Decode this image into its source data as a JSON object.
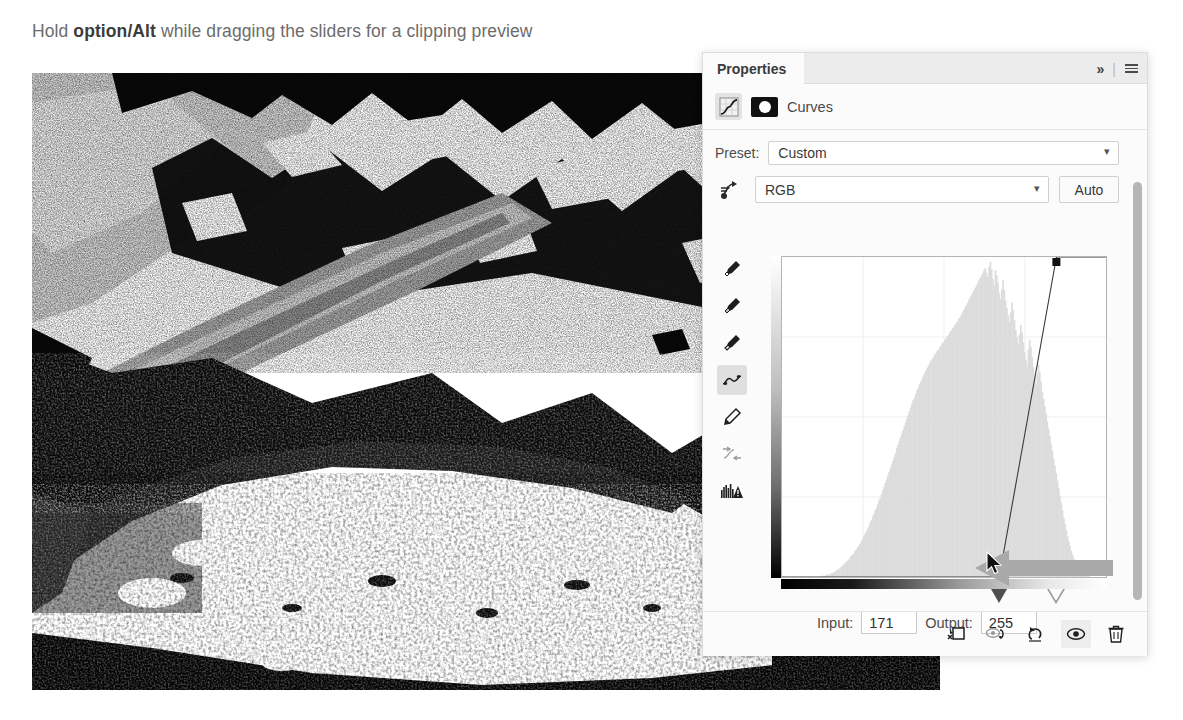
{
  "caption": {
    "prefix": "Hold ",
    "bold": "option/Alt",
    "suffix": " while dragging the sliders for a clipping preview"
  },
  "photo": {
    "alt_name": "clipped-glacier-preview",
    "description": "High-contrast black and white glacier and mountain photograph showing clipping preview"
  },
  "panel": {
    "tab_label": "Properties",
    "expand_icon": "chevron-double-right-icon",
    "menu_icon": "hamburger-menu-icon",
    "adjustment": {
      "layer_icon": "curves-adjustment-icon",
      "mask_icon": "layer-mask-icon",
      "title": "Curves"
    },
    "preset": {
      "label": "Preset:",
      "value": "Custom",
      "caret_icon": "chevron-down-icon"
    },
    "channel": {
      "target_icon": "targeted-adjustment-icon",
      "value": "RGB",
      "caret_icon": "chevron-down-icon",
      "auto_label": "Auto"
    },
    "tools": [
      {
        "name": "eyedropper-black-point",
        "icon": "eyedropper-icon",
        "active": false
      },
      {
        "name": "eyedropper-gray-point",
        "icon": "eyedropper-icon",
        "active": false
      },
      {
        "name": "eyedropper-white-point",
        "icon": "eyedropper-icon",
        "active": false
      },
      {
        "name": "curve-point-tool",
        "icon": "curve-icon",
        "active": true
      },
      {
        "name": "pencil-draw-tool",
        "icon": "pencil-icon",
        "active": false
      },
      {
        "name": "smooth-curve-tool",
        "icon": "smooth-curve-icon",
        "active": false
      },
      {
        "name": "histogram-display-toggle",
        "icon": "histogram-warning-icon",
        "active": false
      }
    ],
    "values": {
      "input_label": "Input:",
      "input_value": "171",
      "output_label": "Output:",
      "output_value": "255"
    },
    "bottom_tools": [
      {
        "name": "clip-to-layer-button",
        "icon": "clip-to-layer-icon",
        "active": false
      },
      {
        "name": "view-previous-state-button",
        "icon": "previous-state-icon",
        "active": false
      },
      {
        "name": "reset-adjustment-button",
        "icon": "reset-arrow-icon",
        "active": false
      },
      {
        "name": "toggle-layer-visibility-button",
        "icon": "eye-icon",
        "active": true
      },
      {
        "name": "delete-adjustment-button",
        "icon": "trash-icon",
        "active": false
      }
    ],
    "scrollbar": {
      "name": "panel-vertical-scrollbar"
    }
  },
  "chart_data": {
    "type": "line",
    "xlabel": "Input",
    "ylabel": "Output",
    "xlim": [
      0,
      255
    ],
    "ylim": [
      0,
      255
    ],
    "grid": true,
    "grid_divisions": 4,
    "series": [
      {
        "name": "RGB tone curve",
        "points": [
          {
            "input": 0,
            "output": 0
          },
          {
            "input": 171,
            "output": 0
          },
          {
            "input": 216,
            "output": 255
          },
          {
            "input": 255,
            "output": 255
          }
        ],
        "control_points": [
          {
            "input": 171,
            "output": 0,
            "selected": false,
            "style": "hollow-square"
          },
          {
            "input": 216,
            "output": 255,
            "selected": true,
            "style": "filled-square"
          }
        ]
      }
    ],
    "histogram": {
      "name": "image-luminance-histogram",
      "bins": [
        0,
        0,
        0,
        0,
        0,
        0,
        0,
        0,
        0,
        0,
        0,
        0,
        0,
        0,
        0,
        0,
        0,
        0,
        0,
        0,
        0,
        0,
        0,
        0,
        0,
        0,
        0,
        0,
        0,
        0,
        0,
        1,
        1,
        1,
        1,
        2,
        2,
        2,
        3,
        3,
        4,
        4,
        5,
        6,
        6,
        7,
        8,
        9,
        10,
        11,
        12,
        13,
        14,
        15,
        17,
        18,
        19,
        21,
        22,
        24,
        25,
        27,
        29,
        31,
        33,
        35,
        37,
        39,
        41,
        44,
        46,
        49,
        51,
        54,
        56,
        59,
        62,
        64,
        67,
        70,
        73,
        76,
        79,
        82,
        85,
        88,
        91,
        94,
        97,
        100,
        104,
        107,
        110,
        113,
        116,
        119,
        122,
        125,
        128,
        131,
        134,
        137,
        140,
        143,
        145,
        148,
        151,
        153,
        156,
        158,
        160,
        163,
        165,
        167,
        169,
        171,
        173,
        175,
        176,
        178,
        180,
        181,
        183,
        184,
        186,
        187,
        189,
        190,
        192,
        193,
        195,
        196,
        198,
        199,
        201,
        202,
        204,
        205,
        207,
        209,
        210,
        212,
        214,
        216,
        218,
        220,
        222,
        224,
        226,
        228,
        230,
        232,
        234,
        236,
        238,
        240,
        242,
        244,
        246,
        248,
        250,
        246,
        243,
        251,
        255,
        249,
        241,
        236,
        248,
        244,
        238,
        230,
        225,
        233,
        240,
        232,
        224,
        218,
        212,
        206,
        214,
        222,
        216,
        208,
        200,
        194,
        188,
        196,
        204,
        198,
        190,
        182,
        176,
        170,
        184,
        192,
        186,
        178,
        170,
        162,
        156,
        164,
        172,
        166,
        158,
        150,
        144,
        138,
        132,
        126,
        120,
        114,
        108,
        102,
        96,
        90,
        84,
        78,
        72,
        66,
        60,
        54,
        48,
        43,
        38,
        33,
        29,
        25,
        21,
        18,
        15,
        12,
        10,
        8,
        6,
        5,
        4,
        3,
        2,
        2,
        1,
        1,
        1,
        0,
        0,
        0,
        0,
        0,
        0,
        0,
        0,
        0,
        0,
        0,
        0,
        0
      ],
      "max": 255
    },
    "gradient_bars": {
      "horizontal": "black-to-white",
      "vertical": "white-to-black"
    },
    "sliders": [
      {
        "name": "black-point-slider",
        "position": 171,
        "style": "filled"
      },
      {
        "name": "white-point-slider",
        "position": 216,
        "style": "hollow"
      }
    ]
  },
  "annotation": {
    "arrow_name": "pointer-arrow-annotation",
    "cursor_name": "mouse-cursor"
  }
}
